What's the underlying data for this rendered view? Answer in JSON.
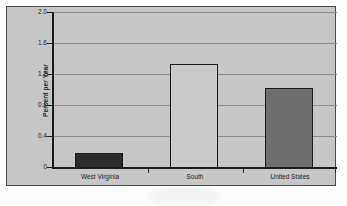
{
  "chart_data": {
    "type": "bar",
    "title": "",
    "xlabel": "",
    "ylabel": "Percent per Year",
    "categories": [
      "West Virginia",
      "South",
      "United States"
    ],
    "values": [
      0.19,
      1.33,
      1.03
    ],
    "series": [
      {
        "name": "Percent per Year",
        "values": [
          0.19,
          1.33,
          1.03
        ]
      }
    ],
    "ylim": [
      0,
      2.0
    ],
    "yticks": [
      0,
      0.4,
      0.8,
      1.2,
      1.6,
      2.0
    ],
    "ytick_labels": [
      "0",
      "0.4",
      "0.8",
      "1.2",
      "1.6",
      "2.0"
    ],
    "grid": true,
    "gridlines_horizontal": true,
    "legend": "none",
    "bar_colors": [
      "#2b2b2b",
      "#c9c9c9",
      "#6e6e6e"
    ],
    "bar_border_color": "#1a1a1a",
    "plot_background": "#c6c6c6",
    "axis_color": "#1c1c1c",
    "gridline_color": "#8d8d8d"
  }
}
